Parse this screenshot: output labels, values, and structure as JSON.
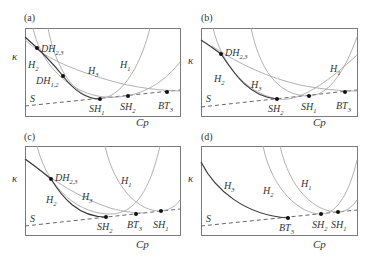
{
  "figure": {
    "panels": [
      {
        "id": "(a)",
        "ylabel": "κ",
        "xlabel": "Cp",
        "curve_labels": [
          {
            "name": "H",
            "sub": "1"
          },
          {
            "name": "H",
            "sub": "2"
          },
          {
            "name": "H",
            "sub": "3"
          },
          {
            "name": "S",
            "sub": ""
          }
        ],
        "points": [
          {
            "name": "DH",
            "sub": "2,3"
          },
          {
            "name": "DH",
            "sub": "1,2"
          },
          {
            "name": "SH",
            "sub": "1"
          },
          {
            "name": "SH",
            "sub": "2"
          },
          {
            "name": "BT",
            "sub": "3"
          }
        ]
      },
      {
        "id": "(b)",
        "ylabel": "κ",
        "xlabel": "Cp",
        "curve_labels": [
          {
            "name": "H",
            "sub": "1"
          },
          {
            "name": "H",
            "sub": "2"
          },
          {
            "name": "H",
            "sub": "3"
          },
          {
            "name": "S",
            "sub": ""
          }
        ],
        "points": [
          {
            "name": "DH",
            "sub": "2,3"
          },
          {
            "name": "SH",
            "sub": "2"
          },
          {
            "name": "SH",
            "sub": "1"
          },
          {
            "name": "BT",
            "sub": "3"
          }
        ]
      },
      {
        "id": "(c)",
        "ylabel": "κ",
        "xlabel": "Cp",
        "curve_labels": [
          {
            "name": "H",
            "sub": "1"
          },
          {
            "name": "H",
            "sub": "2"
          },
          {
            "name": "H",
            "sub": "3"
          },
          {
            "name": "S",
            "sub": ""
          }
        ],
        "points": [
          {
            "name": "DH",
            "sub": "2,3"
          },
          {
            "name": "SH",
            "sub": "2"
          },
          {
            "name": "BT",
            "sub": "3"
          },
          {
            "name": "SH",
            "sub": "1"
          }
        ]
      },
      {
        "id": "(d)",
        "ylabel": "κ",
        "xlabel": "Cp",
        "curve_labels": [
          {
            "name": "H",
            "sub": "3"
          },
          {
            "name": "H",
            "sub": "2"
          },
          {
            "name": "H",
            "sub": "1"
          },
          {
            "name": "S",
            "sub": ""
          }
        ],
        "points": [
          {
            "name": "BT",
            "sub": "3"
          },
          {
            "name": "SH",
            "sub": "2"
          },
          {
            "name": "SH",
            "sub": "1"
          }
        ]
      }
    ]
  }
}
